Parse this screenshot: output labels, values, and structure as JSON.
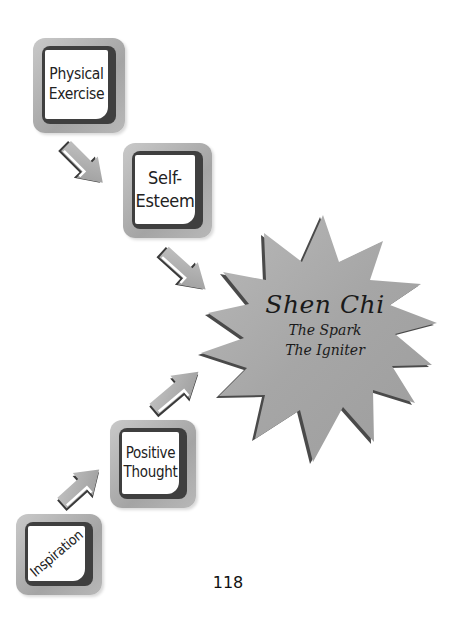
{
  "boxes": {
    "physical_exercise": {
      "line1": "Physical",
      "line2": "Exercise"
    },
    "self_esteem": {
      "line1": "Self-",
      "line2": "Esteem"
    },
    "positive_thought": {
      "line1": "Positive",
      "line2": "Thought"
    },
    "inspiration": {
      "label": "Inspiration"
    }
  },
  "star": {
    "title": "Shen Chi",
    "line1": "The Spark",
    "line2": "The Igniter",
    "fill": "#a9a9a9",
    "shadow": "#4a4a4a"
  },
  "arrows": [
    {
      "from": "Physical Exercise",
      "to": "Self-Esteem",
      "direction": "down-right"
    },
    {
      "from": "Self-Esteem",
      "to": "Shen Chi",
      "direction": "down-right"
    },
    {
      "from": "Inspiration",
      "to": "Positive Thought",
      "direction": "up-right"
    },
    {
      "from": "Positive Thought",
      "to": "Shen Chi",
      "direction": "up-right"
    }
  ],
  "page_number": "118"
}
